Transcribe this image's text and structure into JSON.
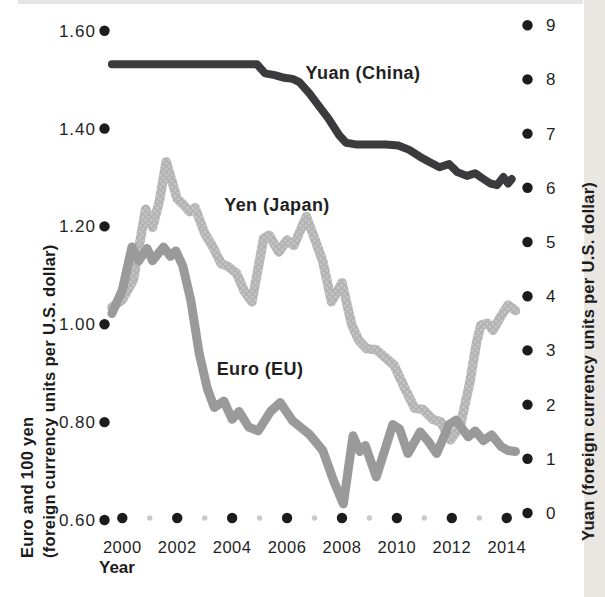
{
  "chart_data": {
    "type": "line",
    "title": "",
    "x_axis": {
      "label": "Year",
      "tick_years": [
        2000,
        2002,
        2004,
        2006,
        2008,
        2010,
        2012,
        2014
      ],
      "minor_tick_years": [
        2001,
        2003,
        2005,
        2007,
        2009,
        2011,
        2013
      ],
      "range": [
        2000,
        2014
      ]
    },
    "y_axis_left": {
      "label_line1": "Euro and 100 yen",
      "label_line2": "(foreign currency units per U.S. dollar)",
      "tick_labels": [
        "1.60",
        "1.40",
        "1.20",
        "1.00",
        "0.80",
        "0.60"
      ],
      "range": [
        0.6,
        1.6
      ]
    },
    "y_axis_right": {
      "label": "Yuan (foreign currency units per U.S. dollar)",
      "tick_labels": [
        "9",
        "8",
        "7",
        "6",
        "5",
        "4",
        "3",
        "2",
        "1",
        "0"
      ],
      "range": [
        0,
        9
      ]
    },
    "grid": "off",
    "legend_position": "inline-labels",
    "colors": {
      "yuan_line": "#3b3b3d",
      "yen_line": "#b4b4b4",
      "yen_texture_dot": "#cfcfcf",
      "euro_line": "#9a9a9a",
      "axis_dot": "#1c1c1c",
      "minor_dot": "#c9c9c9",
      "scan_band": "#eae6e2",
      "top_streak": "#cfcfcd"
    },
    "series": [
      {
        "name": "Yuan (China)",
        "axis": "right",
        "color": "#3b3b3d",
        "points": [
          [
            1999.62,
            8.28
          ],
          [
            2004.9,
            8.28
          ],
          [
            2005.2,
            8.11
          ],
          [
            2005.55,
            8.08
          ],
          [
            2005.9,
            8.03
          ],
          [
            2006.2,
            8.01
          ],
          [
            2006.45,
            7.95
          ],
          [
            2006.8,
            7.75
          ],
          [
            2007.1,
            7.55
          ],
          [
            2007.5,
            7.28
          ],
          [
            2007.9,
            6.97
          ],
          [
            2008.15,
            6.83
          ],
          [
            2008.5,
            6.8
          ],
          [
            2009.6,
            6.8
          ],
          [
            2010.05,
            6.78
          ],
          [
            2010.45,
            6.7
          ],
          [
            2010.85,
            6.57
          ],
          [
            2011.2,
            6.47
          ],
          [
            2011.55,
            6.38
          ],
          [
            2011.9,
            6.44
          ],
          [
            2012.2,
            6.29
          ],
          [
            2012.55,
            6.22
          ],
          [
            2012.85,
            6.27
          ],
          [
            2013.1,
            6.18
          ],
          [
            2013.4,
            6.08
          ],
          [
            2013.65,
            6.05
          ],
          [
            2013.88,
            6.2
          ],
          [
            2014.05,
            6.08
          ],
          [
            2014.18,
            6.16
          ]
        ]
      },
      {
        "name": "Yen (Japan)",
        "axis": "left",
        "color": "#b4b4b4",
        "texture": "halftone",
        "points": [
          [
            1999.62,
            1.035
          ],
          [
            2000.0,
            1.05
          ],
          [
            2000.4,
            1.09
          ],
          [
            2000.85,
            1.235
          ],
          [
            2001.1,
            1.198
          ],
          [
            2001.35,
            1.252
          ],
          [
            2001.6,
            1.332
          ],
          [
            2001.82,
            1.29
          ],
          [
            2002.0,
            1.256
          ],
          [
            2002.2,
            1.246
          ],
          [
            2002.45,
            1.23
          ],
          [
            2002.65,
            1.238
          ],
          [
            2003.0,
            1.186
          ],
          [
            2003.3,
            1.158
          ],
          [
            2003.6,
            1.124
          ],
          [
            2003.85,
            1.118
          ],
          [
            2004.15,
            1.105
          ],
          [
            2004.45,
            1.067
          ],
          [
            2004.72,
            1.046
          ],
          [
            2005.15,
            1.176
          ],
          [
            2005.35,
            1.182
          ],
          [
            2005.7,
            1.148
          ],
          [
            2006.0,
            1.172
          ],
          [
            2006.25,
            1.161
          ],
          [
            2006.7,
            1.22
          ],
          [
            2007.0,
            1.176
          ],
          [
            2007.3,
            1.128
          ],
          [
            2007.62,
            1.046
          ],
          [
            2008.0,
            1.085
          ],
          [
            2008.35,
            1.0
          ],
          [
            2008.6,
            0.968
          ],
          [
            2008.9,
            0.95
          ],
          [
            2009.25,
            0.948
          ],
          [
            2009.9,
            0.916
          ],
          [
            2010.3,
            0.868
          ],
          [
            2010.65,
            0.828
          ],
          [
            2010.95,
            0.826
          ],
          [
            2011.3,
            0.806
          ],
          [
            2011.6,
            0.8
          ],
          [
            2011.95,
            0.764
          ],
          [
            2012.3,
            0.79
          ],
          [
            2012.65,
            0.88
          ],
          [
            2012.9,
            0.962
          ],
          [
            2013.05,
            0.998
          ],
          [
            2013.3,
            1.002
          ],
          [
            2013.5,
            0.988
          ],
          [
            2013.75,
            1.013
          ],
          [
            2014.05,
            1.039
          ],
          [
            2014.32,
            1.028
          ]
        ]
      },
      {
        "name": "Euro (EU)",
        "axis": "left",
        "color": "#9a9a9a",
        "points": [
          [
            1999.62,
            1.022
          ],
          [
            2000.0,
            1.07
          ],
          [
            2000.35,
            1.158
          ],
          [
            2000.6,
            1.13
          ],
          [
            2000.9,
            1.155
          ],
          [
            2001.1,
            1.13
          ],
          [
            2001.5,
            1.158
          ],
          [
            2001.75,
            1.139
          ],
          [
            2001.95,
            1.15
          ],
          [
            2002.2,
            1.12
          ],
          [
            2002.5,
            1.048
          ],
          [
            2002.8,
            0.94
          ],
          [
            2003.1,
            0.868
          ],
          [
            2003.35,
            0.83
          ],
          [
            2003.7,
            0.843
          ],
          [
            2004.0,
            0.806
          ],
          [
            2004.25,
            0.822
          ],
          [
            2004.6,
            0.79
          ],
          [
            2004.95,
            0.782
          ],
          [
            2005.4,
            0.822
          ],
          [
            2005.75,
            0.84
          ],
          [
            2006.2,
            0.803
          ],
          [
            2006.8,
            0.776
          ],
          [
            2007.3,
            0.742
          ],
          [
            2007.7,
            0.68
          ],
          [
            2008.05,
            0.633
          ],
          [
            2008.4,
            0.772
          ],
          [
            2008.65,
            0.74
          ],
          [
            2008.85,
            0.752
          ],
          [
            2009.25,
            0.688
          ],
          [
            2009.85,
            0.795
          ],
          [
            2010.1,
            0.786
          ],
          [
            2010.4,
            0.736
          ],
          [
            2010.85,
            0.78
          ],
          [
            2011.15,
            0.76
          ],
          [
            2011.45,
            0.736
          ],
          [
            2011.9,
            0.795
          ],
          [
            2012.15,
            0.804
          ],
          [
            2012.6,
            0.77
          ],
          [
            2012.85,
            0.782
          ],
          [
            2013.15,
            0.762
          ],
          [
            2013.45,
            0.774
          ],
          [
            2013.8,
            0.75
          ],
          [
            2014.05,
            0.742
          ],
          [
            2014.32,
            0.74
          ]
        ]
      }
    ]
  }
}
